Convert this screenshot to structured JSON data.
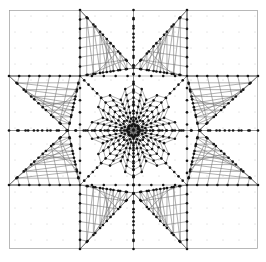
{
  "figure": {
    "type": "mesh-diagram",
    "background_color": "#ffffff",
    "frame_color": "#9a9a9a",
    "mesh_line_color": "#6f6f6f",
    "vertex_color": "#141414",
    "background_grid_dot_color": "#e8e8e8",
    "width": 266,
    "height": 262
  },
  "chart_data": {
    "type": "scatter",
    "xlabel": "",
    "ylabel": "",
    "xlim": [
      9,
      258
    ],
    "ylim": [
      10,
      249
    ],
    "grid": true,
    "legend": "none",
    "annotations": [],
    "geometry": {
      "center": [
        133.5,
        130.5
      ],
      "frame": {
        "x0": 9,
        "y0": 10,
        "x1": 258,
        "y1": 249
      },
      "inner_square": {
        "x0": 80,
        "y0": 76,
        "x1": 187,
        "y1": 185
      },
      "axis_lines": {
        "vertical_left": 80,
        "vertical_right": 187,
        "horizontal_top": 76,
        "horizontal_bottom": 185,
        "center_vertical": 133.5,
        "center_horizontal": 130.5
      },
      "star_points": 8,
      "background_dot_spacing": 16
    },
    "star_outline": [
      [
        80,
        10
      ],
      [
        133.5,
        68
      ],
      [
        187,
        10
      ],
      [
        187,
        76
      ],
      [
        258,
        76
      ],
      [
        199,
        130.5
      ],
      [
        258,
        185
      ],
      [
        187,
        185
      ],
      [
        187,
        249
      ],
      [
        133.5,
        193
      ],
      [
        80,
        249
      ],
      [
        80,
        185
      ],
      [
        9,
        185
      ],
      [
        68,
        130.5
      ],
      [
        9,
        76
      ],
      [
        80,
        76
      ]
    ],
    "radial_fan": {
      "hub": [
        133.5,
        130.5
      ],
      "spoke_count": 32,
      "ring_count": 7,
      "description": "Dense triangular fan converging at the figure centre"
    },
    "vertex_count_estimate": 290,
    "edge_count_estimate": 430
  }
}
